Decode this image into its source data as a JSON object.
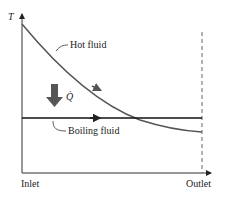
{
  "diagram": {
    "y_axis_label": "T",
    "x_axis_start_label": "Inlet",
    "x_axis_end_label": "Outlet",
    "curves": [
      {
        "name": "Hot fluid",
        "label": "Hot fluid",
        "color": "#555555",
        "shape": "decreasing exponential"
      },
      {
        "name": "Boiling fluid",
        "label": "Boiling fluid",
        "color": "#111111",
        "shape": "constant horizontal"
      }
    ],
    "heat_transfer_label": "Q̇",
    "heat_arrow_color": "#555555",
    "outlet_marker": "dashed vertical line"
  }
}
